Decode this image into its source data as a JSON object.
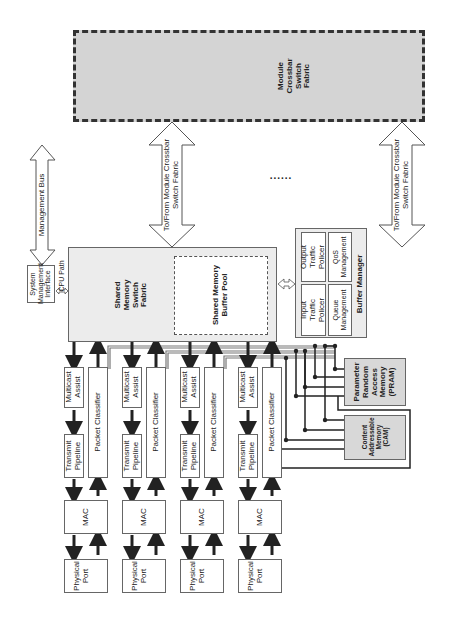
{
  "diagram": {
    "orientation": "rotated-90-ccw",
    "crossbar": {
      "label": "Module\nCrossbar\nSwitch\nFabric",
      "fill": "#d4d4d4"
    },
    "crossbar_links": [
      {
        "label": "To/From Module Crossbar\nSwitch Fabric"
      },
      {
        "label": "To/From Module Crossbar\nSwitch Fabric"
      }
    ],
    "ellipsis": "......",
    "management_bus": {
      "label": "Management Bus"
    },
    "system_management_interface": {
      "label": "System\nManagement\nInterface"
    },
    "cpu_path": {
      "label": "CPU Path"
    },
    "shared_memory_switch_fabric": {
      "label": "Shared\nMemory\nSwitch\nFabric"
    },
    "shared_memory_buffer_pool": {
      "label": "Shared Memory\nBuffer Pool"
    },
    "buffer_manager": {
      "title": "Buffer Manager",
      "cells": [
        {
          "label": "Input\nTraffic\nPolicer"
        },
        {
          "label": "Output\nTraffic\nPolicer"
        },
        {
          "label": "Queue\nManagement"
        },
        {
          "label": "QoS\nManagement"
        }
      ]
    },
    "ports": [
      {
        "multicast": "Multicast\nAssist",
        "transmit": "Transmit\nPipeline",
        "classifier": "Packet Classifier",
        "mac": "MAC",
        "phy": "Physical\nPort"
      },
      {
        "multicast": "Multicast\nAssist",
        "transmit": "Transmit\nPipeline",
        "classifier": "Packet Classifier",
        "mac": "MAC",
        "phy": "Physical\nPort"
      },
      {
        "multicast": "Multicast\nAssist",
        "transmit": "Transmit\nPipeline",
        "classifier": "Packet Classifier",
        "mac": "MAC",
        "phy": "Physical\nPort"
      },
      {
        "multicast": "Multicast\nAssist",
        "transmit": "Transmit\nPipeline",
        "classifier": "Packet Classifier",
        "mac": "MAC",
        "phy": "Physical\nPort"
      }
    ],
    "pram": {
      "label": "Parameter\nRandom\nAccess\nMemory\n(PRAM)"
    },
    "cam": {
      "label": "Content\nAddressable\nMemory\n(CAM)"
    }
  }
}
